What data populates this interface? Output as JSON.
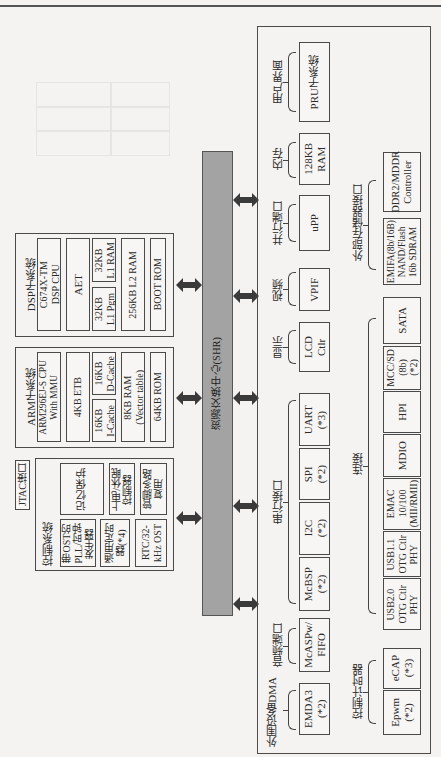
{
  "diagram": {
    "bus_label": "资源交换中心(SHR)",
    "dsp": {
      "title": "DSP子系统",
      "cpu": "C674X-TM\nDSP CPU",
      "aet": "AET",
      "l1p": "32KB\nL1 Pgm",
      "l1r": "32KB\nL1 RAM",
      "l2": "256KB L2 RAM",
      "boot": "BOOT ROM"
    },
    "arm": {
      "title": "ARM子系统",
      "cpu": "ARM296EJ-S CPU\nWith MMU",
      "etb": "4KB ETB",
      "icache": "16KB\nI-Cache",
      "dcache": "16KB\nD-Cache",
      "ram": "8KB RAM\n(Vector table)",
      "rom": "64KB ROM"
    },
    "jtag": "JTAC接口",
    "control": {
      "title": "控制系统",
      "pll": "带OST的\nPLL/时钟\n发生器",
      "mem_protect": "记忆保护",
      "timer": "通用定时\n器(*4)",
      "power": "上电/休眠\n控制器",
      "rtc": "RTC/32-\nkHz OST",
      "pinmux": "管脚多路\n复用"
    },
    "peripherals": {
      "groups_top": [
        {
          "label": "用户界面",
          "items": [
            "PRU子系统"
          ]
        },
        {
          "label": "内存",
          "items": [
            "128KB\nRAM"
          ]
        },
        {
          "label": "并行端口",
          "items": [
            "uPP"
          ]
        },
        {
          "label": "视频",
          "items": [
            "VPIF"
          ]
        },
        {
          "label": "显示",
          "items": [
            "LCD\nCtlr"
          ]
        },
        {
          "label": "串行接口",
          "items": [
            "UART\n(*3)",
            "SPI\n(*2)",
            "I2C\n(*2)",
            "McBSP\n(*2)"
          ]
        },
        {
          "label": "音频端口",
          "items": [
            "McASPw/\nFIFO"
          ]
        },
        {
          "label": "外围设备DMA",
          "items": [
            "EMDA3\n(*2)"
          ]
        }
      ],
      "groups_bottom": [
        {
          "label": "外部存储器接口",
          "items": [
            "DDR2/MDDR\nController",
            "EMIFA(8b/16B)\nNAND/Flash\n16b SDRAM"
          ]
        },
        {
          "label": "连接",
          "items": [
            "SATA",
            "MCC/SD\n(8b)\n(*2)",
            "HPI",
            "MDIO",
            "EMAC\n10/100\n(MII/RMII)",
            "USB1.1\nOTG Ctlr\nPHY",
            "USB2.0\nOTG Ctlr\nPHY"
          ]
        },
        {
          "label": "控制计时器",
          "items": [
            "eCAP\n(*3)",
            "Epwm\n(*2)"
          ]
        }
      ]
    }
  }
}
